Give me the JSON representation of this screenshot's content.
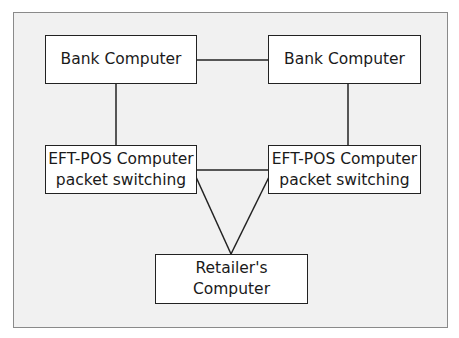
{
  "diagram": {
    "title": "",
    "nodes": [
      {
        "id": "bank-left",
        "lines": [
          "Bank Computer"
        ]
      },
      {
        "id": "bank-right",
        "lines": [
          "Bank Computer"
        ]
      },
      {
        "id": "eft-left",
        "lines": [
          "EFT-POS Computer",
          "packet switching"
        ]
      },
      {
        "id": "eft-right",
        "lines": [
          "EFT-POS Computer",
          "packet switching"
        ]
      },
      {
        "id": "retailer",
        "lines": [
          "Retailer's Computer"
        ]
      }
    ],
    "edges": [
      {
        "from": "bank-left",
        "to": "bank-right"
      },
      {
        "from": "bank-left",
        "to": "eft-left"
      },
      {
        "from": "bank-right",
        "to": "eft-right"
      },
      {
        "from": "eft-left",
        "to": "eft-right"
      },
      {
        "from": "eft-left",
        "to": "retailer"
      },
      {
        "from": "eft-right",
        "to": "retailer"
      }
    ],
    "colors": {
      "frame_bg": "#f1f1f1",
      "frame_border": "#8a8a8a",
      "box_bg": "#ffffff",
      "line": "#222222"
    }
  }
}
